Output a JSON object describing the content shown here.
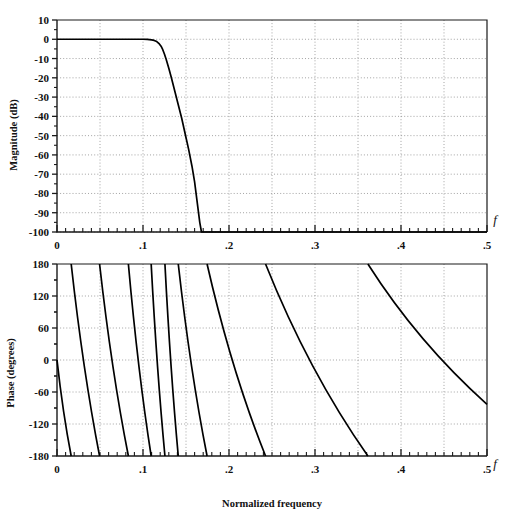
{
  "figure": {
    "background": "#ffffff",
    "line_color": "#000000",
    "grid_color": "#8d8d8d",
    "axis_color": "#1a1a1a"
  },
  "chart_data": [
    {
      "id": "magnitude",
      "type": "line",
      "title": "",
      "xlabel": "",
      "ylabel": "Magnitude (dB)",
      "xlim": [
        0,
        0.5
      ],
      "ylim": [
        -100,
        10
      ],
      "xticks": [
        0,
        0.1,
        0.2,
        0.3,
        0.4,
        0.5
      ],
      "xticklabels": [
        "0",
        ".1",
        ".2",
        ".3",
        ".4",
        ".5"
      ],
      "yticks": [
        10,
        0,
        -10,
        -20,
        -30,
        -40,
        -50,
        -60,
        -70,
        -80,
        -90,
        -100
      ],
      "yticklabels": [
        "10",
        "0",
        "-10",
        "-20",
        "-30",
        "-40",
        "-50",
        "-60",
        "-70",
        "-80",
        "-90",
        "-100"
      ],
      "x_minor_tick_step": 0.01,
      "grid": "dotted",
      "legend": "none",
      "axis_symbol": "f",
      "series": [
        {
          "name": "Magnitude response",
          "x": [
            0.0,
            0.005,
            0.01,
            0.02,
            0.03,
            0.04,
            0.05,
            0.06,
            0.07,
            0.08,
            0.09,
            0.1,
            0.105,
            0.11,
            0.113,
            0.116,
            0.119,
            0.121,
            0.123,
            0.125,
            0.127,
            0.13,
            0.133,
            0.137,
            0.141,
            0.145,
            0.149,
            0.153,
            0.157,
            0.16,
            0.162,
            0.164,
            0.166,
            0.168,
            0.2,
            0.25,
            0.3,
            0.35,
            0.4,
            0.45,
            0.5
          ],
          "y": [
            0.0,
            0.0,
            0.0,
            0.0,
            0.0,
            0.0,
            0.0,
            0.0,
            0.0,
            0.0,
            0.0,
            0.0,
            -0.1,
            -0.3,
            -0.6,
            -1.2,
            -2.4,
            -3.6,
            -5.4,
            -7.8,
            -10.5,
            -15.0,
            -20.0,
            -27.0,
            -34.0,
            -41.0,
            -49.0,
            -57.0,
            -66.0,
            -74.0,
            -81.0,
            -88.0,
            -95.0,
            -100.0,
            -100.0,
            -100.0,
            -100.0,
            -100.0,
            -100.0,
            -100.0,
            -100.0
          ]
        }
      ]
    },
    {
      "id": "phase",
      "type": "line",
      "title": "",
      "xlabel": "Normalized  frequency",
      "ylabel": "Phase (degrees)",
      "xlim": [
        0,
        0.5
      ],
      "ylim": [
        -180,
        180
      ],
      "xticks": [
        0,
        0.1,
        0.2,
        0.3,
        0.4,
        0.5
      ],
      "xticklabels": [
        "0",
        ".1",
        ".2",
        ".3",
        ".4",
        ".5"
      ],
      "yticks": [
        180,
        120,
        60,
        0,
        -60,
        -120,
        -180
      ],
      "yticklabels": [
        "180",
        "120",
        "60",
        "0",
        "-60",
        "-120",
        "-180"
      ],
      "x_minor_tick_step": 0.01,
      "grid": "dotted",
      "legend": "none",
      "axis_symbol": "f",
      "description": "Linear phase wrapping between +180 and -180 degrees; branch slope steepens then the wraps spread apart at higher frequency.",
      "branches": [
        {
          "x_start": 0.0,
          "y_start": 0.0,
          "x_end": 0.0165,
          "y_end": -180
        },
        {
          "x_start": 0.0165,
          "y_start": 180,
          "x_end": 0.0495,
          "y_end": -180
        },
        {
          "x_start": 0.0495,
          "y_start": 180,
          "x_end": 0.083,
          "y_end": -180
        },
        {
          "x_start": 0.083,
          "y_start": 180,
          "x_end": 0.1095,
          "y_end": -180
        },
        {
          "x_start": 0.1095,
          "y_start": 180,
          "x_end": 0.1255,
          "y_end": -180
        },
        {
          "x_start": 0.1255,
          "y_start": 180,
          "x_end": 0.141,
          "y_end": -180
        },
        {
          "x_start": 0.141,
          "y_start": 180,
          "x_end": 0.1745,
          "y_end": -180
        },
        {
          "x_start": 0.1745,
          "y_start": 180,
          "x_end": 0.2425,
          "y_end": -180
        },
        {
          "x_start": 0.2425,
          "y_start": 180,
          "x_end": 0.3615,
          "y_end": -180
        },
        {
          "x_start": 0.3615,
          "y_start": 180,
          "x_end": 0.5,
          "y_end": -83
        }
      ]
    }
  ]
}
